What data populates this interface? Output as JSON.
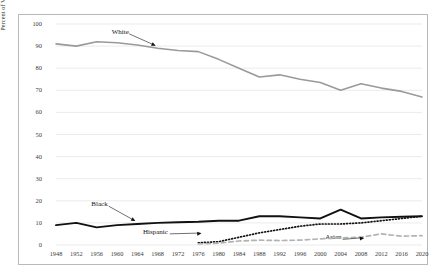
{
  "chart_data": {
    "type": "line",
    "title": "",
    "xlabel": "",
    "ylabel": "Percent of Votes Cast by Race",
    "ylim": [
      0,
      100
    ],
    "ytick_step": 10,
    "yticks": [
      0,
      10,
      20,
      30,
      40,
      50,
      60,
      70,
      80,
      90,
      100
    ],
    "grid": true,
    "grid_axis": "y",
    "legend_position": "inline-annotations",
    "x": [
      1948,
      1952,
      1956,
      1960,
      1964,
      1968,
      1972,
      1976,
      1980,
      1984,
      1988,
      1992,
      1996,
      2000,
      2004,
      2008,
      2012,
      2016,
      2020
    ],
    "categories": [
      "1948",
      "1952",
      "1956",
      "1960",
      "1964",
      "1968",
      "1972",
      "1976",
      "1980",
      "1984",
      "1988",
      "1992",
      "1996",
      "2000",
      "2004",
      "2008",
      "2012",
      "2016",
      "2020"
    ],
    "series": [
      {
        "name": "White",
        "color": "#9a9a9a",
        "style": "solid",
        "width": 1.6,
        "values": [
          91,
          90,
          92,
          91.5,
          90.5,
          89,
          88,
          87.5,
          84,
          80,
          76,
          77,
          75,
          73.5,
          70,
          73,
          71,
          69.5,
          67
        ],
        "label_x": 1962,
        "label_y": 96,
        "arrow_to_x": 1968,
        "arrow_to_y": 89.5
      },
      {
        "name": "Black",
        "color": "#111111",
        "style": "solid",
        "width": 1.9,
        "values": [
          9,
          10,
          8,
          9,
          9.5,
          10,
          10.3,
          10.5,
          11,
          11,
          13,
          13,
          12.5,
          12,
          16,
          12,
          12.5,
          12.8,
          13
        ],
        "label_x": 1958,
        "label_y": 18,
        "arrow_to_x": 1964,
        "arrow_to_y": 10.2
      },
      {
        "name": "Hispanic",
        "color": "#111111",
        "style": "dotted",
        "width": 1.7,
        "values": [
          null,
          null,
          null,
          null,
          null,
          null,
          null,
          1,
          1.5,
          3.5,
          5.5,
          7,
          8.5,
          9.5,
          9.5,
          10,
          11,
          12,
          13
        ],
        "label_x": 1970,
        "label_y": 5.5,
        "arrow_to_x": 1977,
        "arrow_to_y": 4.5
      },
      {
        "name": "Asian",
        "color": "#b3b3b3",
        "style": "dashed",
        "width": 1.7,
        "values": [
          null,
          null,
          null,
          null,
          null,
          null,
          null,
          0.5,
          0.8,
          1.8,
          2.2,
          2.0,
          2.2,
          2.8,
          3.2,
          3.5,
          5.0,
          4.0,
          4.2
        ],
        "label_x": 2004,
        "label_y": 3.0,
        "arrow_to_x": 2009,
        "arrow_to_y": 2.4
      }
    ]
  }
}
